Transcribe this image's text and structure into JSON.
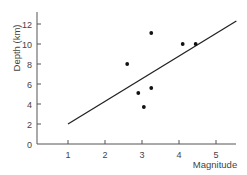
{
  "chart_data": {
    "type": "scatter",
    "title": "",
    "xlabel": "Magnitude",
    "ylabel": "Depth (km)",
    "xlim": [
      0.16,
      5.6
    ],
    "ylim": [
      0,
      13
    ],
    "x_ticks": [
      1,
      2,
      3,
      4,
      5
    ],
    "y_ticks": [
      0,
      2,
      4,
      6,
      8,
      10,
      12
    ],
    "grid": false,
    "legend": null,
    "series": [
      {
        "name": "observations",
        "kind": "scatter",
        "points": [
          {
            "x": 2.6,
            "y": 8.0
          },
          {
            "x": 2.9,
            "y": 5.1
          },
          {
            "x": 3.05,
            "y": 3.7
          },
          {
            "x": 3.25,
            "y": 5.6
          },
          {
            "x": 3.25,
            "y": 11.1
          },
          {
            "x": 4.1,
            "y": 10.0
          },
          {
            "x": 4.45,
            "y": 10.0
          }
        ]
      },
      {
        "name": "trend line",
        "kind": "line",
        "points": [
          {
            "x": 1.0,
            "y": 2.0
          },
          {
            "x": 5.55,
            "y": 12.3
          }
        ]
      }
    ]
  },
  "colors": {
    "axis": "#555555",
    "marker": "#111111",
    "line": "#222222",
    "text": "#444444"
  }
}
